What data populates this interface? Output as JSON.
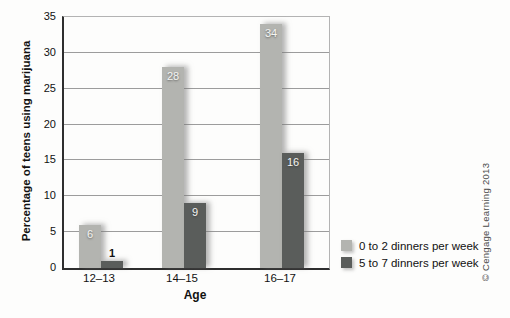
{
  "figure": {
    "credit": "© Cengage Learning 2013"
  },
  "chart_data": {
    "type": "bar",
    "title": "",
    "categories": [
      "12–13",
      "14–15",
      "16–17"
    ],
    "series": [
      {
        "name": "0 to 2 dinners per week",
        "values": [
          6,
          28,
          34
        ],
        "color": "#b3b4b0"
      },
      {
        "name": "5 to 7 dinners per week",
        "values": [
          1,
          9,
          16
        ],
        "color": "#5a5d5b"
      }
    ],
    "xlabel": "Age",
    "ylabel": "Percentage of teens using marijuana",
    "ylim": [
      0,
      35
    ],
    "ytick_step": 5,
    "grid": true,
    "value_labels": true,
    "legend_position": "right-below-plot"
  }
}
